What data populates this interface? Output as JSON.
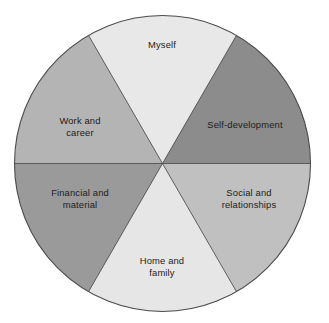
{
  "figure": {
    "name": "life-balance-wheel",
    "background_color": "#ffffff",
    "outline_color": "#4d4d4d"
  },
  "chart_data": {
    "type": "pie",
    "title": "",
    "subtitle": "",
    "xlabel": "",
    "ylabel": "",
    "grid": false,
    "legend_position": "none",
    "labels_placement": "inside-slices",
    "total_slices": 6,
    "equal_slices": true,
    "categories": [
      "Myself",
      "Self-development",
      "Social and relationships",
      "Home and family",
      "Financial and material",
      "Work and career"
    ],
    "values": [
      16.67,
      16.67,
      16.67,
      16.67,
      16.67,
      16.67
    ],
    "slices": [
      {
        "label": "Myself",
        "label_lines": [
          "Myself"
        ],
        "value": 16.67,
        "start_angle_deg": 60,
        "end_angle_deg": 120,
        "color": "#e8e8e8",
        "label_x": 162,
        "label_y": 48
      },
      {
        "label": "Self-development",
        "label_lines": [
          "Self-development"
        ],
        "value": 16.67,
        "start_angle_deg": 0,
        "end_angle_deg": 60,
        "color": "#8c8c8c",
        "label_x": 245,
        "label_y": 128
      },
      {
        "label": "Social and relationships",
        "label_lines": [
          "Social and",
          "relationships"
        ],
        "value": 16.67,
        "start_angle_deg": 300,
        "end_angle_deg": 360,
        "color": "#c0c0c0",
        "label_x": 249,
        "label_y": 196
      },
      {
        "label": "Home and family",
        "label_lines": [
          "Home and",
          "family"
        ],
        "value": 16.67,
        "start_angle_deg": 240,
        "end_angle_deg": 300,
        "color": "#e6e6e6",
        "label_x": 162,
        "label_y": 264
      },
      {
        "label": "Financial and material",
        "label_lines": [
          "Financial and",
          "material"
        ],
        "value": 16.67,
        "start_angle_deg": 180,
        "end_angle_deg": 240,
        "color": "#9a9a9a",
        "label_x": 80,
        "label_y": 196
      },
      {
        "label": "Work and career",
        "label_lines": [
          "Work and",
          "career"
        ],
        "value": 16.67,
        "start_angle_deg": 120,
        "end_angle_deg": 180,
        "color": "#b4b4b4",
        "label_x": 80,
        "label_y": 124
      }
    ]
  }
}
